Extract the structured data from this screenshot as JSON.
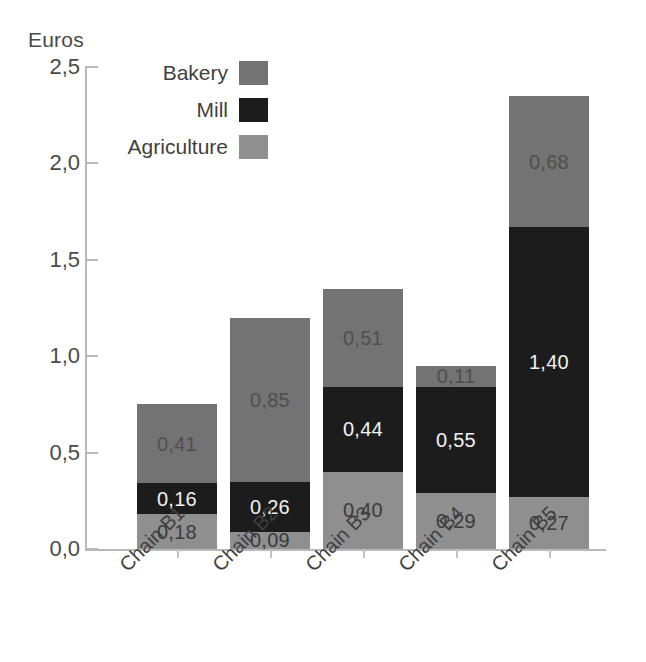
{
  "chart_data": {
    "type": "bar",
    "subtype": "stacked",
    "title": "",
    "ylabel": "Euros",
    "xlabel": "",
    "ylim": [
      0.0,
      2.5
    ],
    "ytick_labels": [
      "2,5",
      "2,0",
      "1,5",
      "1,0",
      "0,5",
      "0,0"
    ],
    "ytick_values": [
      2.5,
      2.0,
      1.5,
      1.0,
      0.5,
      0.0
    ],
    "grid": false,
    "legend_position": "top-left",
    "decimal_separator": ",",
    "categories": [
      "Chain B1",
      "Chain B2",
      "Chain B3",
      "Chain B4",
      "Chain B5"
    ],
    "series": [
      {
        "name": "Agriculture",
        "color": "#8f8f8f",
        "values": [
          0.18,
          0.09,
          0.4,
          0.29,
          0.27
        ],
        "labels": [
          "0,18",
          "0,09",
          "0,40",
          "0,29",
          "0,27"
        ]
      },
      {
        "name": "Mill",
        "color": "#1c1c1c",
        "values": [
          0.16,
          0.26,
          0.44,
          0.55,
          1.4
        ],
        "labels": [
          "0,16",
          "0,26",
          "0,44",
          "0,55",
          "1,40"
        ]
      },
      {
        "name": "Bakery",
        "color": "#737373",
        "values": [
          0.41,
          0.85,
          0.51,
          0.11,
          0.68
        ],
        "labels": [
          "0,41",
          "0,85",
          "0,51",
          "0,11",
          "0,68"
        ]
      }
    ],
    "totals": [
      0.75,
      1.2,
      1.35,
      0.95,
      2.35
    ]
  },
  "legend": {
    "items": [
      {
        "label": "Bakery",
        "color": "#737373"
      },
      {
        "label": "Mill",
        "color": "#1c1c1c"
      },
      {
        "label": "Agriculture",
        "color": "#8f8f8f"
      }
    ]
  },
  "axis": {
    "y_title": "Euros"
  }
}
